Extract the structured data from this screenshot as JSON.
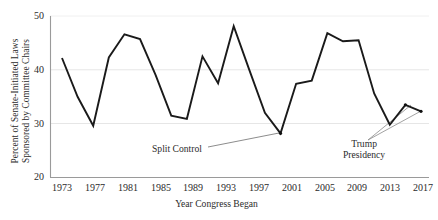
{
  "chart_data": {
    "type": "line",
    "title": "",
    "xlabel": "Year Congress Began",
    "ylabel": "Percent of Senate-Initiated Laws Sponsored by Committee Chairs",
    "ylabel_line1": "Percent of Senate-Initiated Laws",
    "ylabel_line2": "Sponsored by Committee Chairs",
    "xlim": [
      1973,
      2019
    ],
    "ylim": [
      20,
      50
    ],
    "yticks": [
      20,
      30,
      40,
      50
    ],
    "xticks": [
      1973,
      1977,
      1981,
      1985,
      1989,
      1993,
      1997,
      2001,
      2005,
      2009,
      2013,
      2017
    ],
    "grid": "horizontal",
    "legend": "none",
    "line_color": "#1a1a1a",
    "grid_color": "#e3e3e3",
    "axis_color": "#8d8d8d",
    "x": [
      1973,
      1975,
      1977,
      1979,
      1981,
      1983,
      1985,
      1987,
      1989,
      1991,
      1993,
      1995,
      1997,
      1999,
      2001,
      2003,
      2005,
      2007,
      2009,
      2011,
      2013,
      2015,
      2017,
      2019
    ],
    "values": [
      42.2,
      35.0,
      29.6,
      42.3,
      46.6,
      45.7,
      39.0,
      31.5,
      30.9,
      42.5,
      37.5,
      48.1,
      40.0,
      32.0,
      28.2,
      37.4,
      38.0,
      46.8,
      45.3,
      45.5,
      35.6,
      29.8,
      33.5,
      32.3
    ],
    "markers": [
      {
        "x": 2001,
        "y": 28.2,
        "label": "Split Control"
      },
      {
        "x": 2017,
        "y": 33.5,
        "label": "Trump Presidency"
      },
      {
        "x": 2019,
        "y": 32.3,
        "label": "Trump Presidency"
      }
    ],
    "annotations": [
      {
        "name": "split-control",
        "text": "Split Control",
        "points_to": [
          2001,
          28.2
        ]
      },
      {
        "name": "trump-presidency",
        "text_line1": "Trump",
        "text_line2": "Presidency",
        "points_to": [
          2017,
          33.5
        ]
      }
    ]
  },
  "axis": {
    "ytick_labels": [
      "50",
      "40",
      "30",
      "20"
    ],
    "xtick_labels": [
      "1973",
      "1977",
      "1981",
      "1985",
      "1989",
      "1993",
      "1997",
      "2001",
      "2005",
      "2009",
      "2013",
      "2017"
    ],
    "xlabel": "Year Congress Began",
    "ylabel_line1": "Percent of Senate-Initiated Laws",
    "ylabel_line2": "Sponsored by Committee Chairs"
  },
  "annotations": {
    "split_control": "Split Control",
    "trump_line1": "Trump",
    "trump_line2": "Presidency"
  }
}
